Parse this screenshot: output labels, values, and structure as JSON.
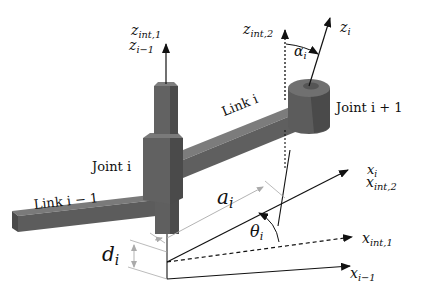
{
  "diagram": {
    "components": {
      "joint_i": "Joint i",
      "joint_i_plus_1": "Joint i + 1",
      "link_i": "Link i",
      "link_i_minus_1": "Link i − 1"
    },
    "axes": {
      "z_int_1": {
        "base": "z",
        "sub": "int,1"
      },
      "z_i_minus_1": {
        "base": "z",
        "sub": "i−1"
      },
      "z_int_2": {
        "base": "z",
        "sub": "int,2"
      },
      "z_i": {
        "base": "z",
        "sub": "i"
      },
      "x_i": {
        "base": "x",
        "sub": "i"
      },
      "x_int_2": {
        "base": "x",
        "sub": "int,2"
      },
      "x_int_1": {
        "base": "x",
        "sub": "int,1"
      },
      "x_i_minus_1": {
        "base": "x",
        "sub": "i−1"
      }
    },
    "parameters": {
      "alpha": {
        "base": "α",
        "sub": "i"
      },
      "a": {
        "base": "a",
        "sub": "i"
      },
      "theta": {
        "base": "θ",
        "sub": "i"
      },
      "d": {
        "base": "d",
        "sub": "i"
      }
    },
    "colors": {
      "link": "#5f5f5f",
      "link_dark": "#474747",
      "link_light": "#7a7a7a",
      "axis": "#111111",
      "dimension": "#9a9a9a"
    }
  }
}
